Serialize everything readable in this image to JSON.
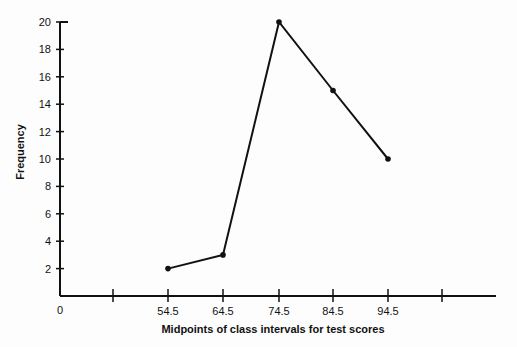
{
  "chart_data": {
    "type": "line",
    "title": "",
    "xlabel": "Midpoints of class intervals for test scores",
    "ylabel": "Frequency",
    "x": [
      54.5,
      64.5,
      74.5,
      84.5,
      94.5
    ],
    "categories": [
      "54.5",
      "64.5",
      "74.5",
      "84.5",
      "94.5"
    ],
    "values": [
      2,
      3,
      20,
      15,
      10
    ],
    "series": [
      {
        "name": "Frequency",
        "values": [
          2,
          3,
          20,
          15,
          10
        ]
      }
    ],
    "x_origin_label": "0",
    "y_ticks": [
      2,
      4,
      6,
      8,
      10,
      12,
      14,
      16,
      18,
      20
    ],
    "ylim": [
      0,
      20
    ],
    "grid": false,
    "legend": "none"
  },
  "colors": {
    "line": "#111111",
    "background": "#fdfdfd"
  }
}
